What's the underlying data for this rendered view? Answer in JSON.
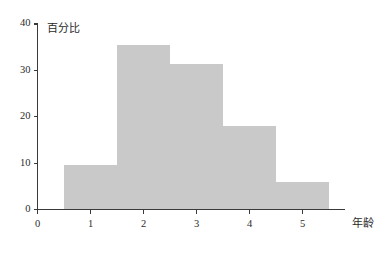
{
  "chart_data": {
    "type": "bar",
    "title": "",
    "subtitle": "",
    "xlabel": "年龄",
    "ylabel": "百分比",
    "categories": [
      "0.5-1.5",
      "1.5-2.5",
      "2.5-3.5",
      "3.5-4.5",
      "4.5-5.5"
    ],
    "bin_edges": [
      0.5,
      1.5,
      2.5,
      3.5,
      4.5,
      5.5
    ],
    "values": [
      9.5,
      35.5,
      31.3,
      18.1,
      6.0
    ],
    "series": [
      {
        "name": "百分比",
        "values": [
          9.5,
          35.5,
          31.3,
          18.1,
          6.0
        ]
      }
    ],
    "xlim": [
      0,
      5.8
    ],
    "ylim": [
      0,
      40
    ],
    "x_ticks": [
      "0",
      "1",
      "2",
      "3",
      "4",
      "5"
    ],
    "x_tick_values": [
      0,
      1,
      2,
      3,
      4,
      5
    ],
    "y_ticks": [
      "0",
      "10",
      "20",
      "30",
      "40"
    ],
    "y_tick_values": [
      0,
      10,
      20,
      30,
      40
    ],
    "grid": false,
    "legend": false,
    "legend_position": "none",
    "bar_color": "#c9c9c9",
    "axis_color": "#3a3a3a",
    "background_color": "#ffffff",
    "annotations": []
  },
  "axes": {
    "y_title": "百分比",
    "x_title": "年龄"
  }
}
